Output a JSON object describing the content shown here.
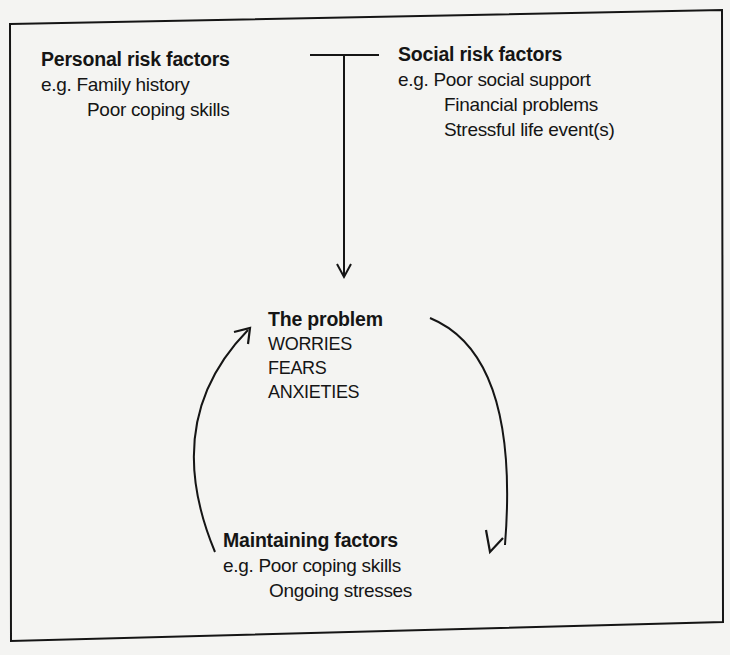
{
  "personal_risk": {
    "title": "Personal risk factors",
    "prefix": "e.g.",
    "items": [
      "Family history",
      "Poor coping skills"
    ]
  },
  "social_risk": {
    "title": "Social risk factors",
    "prefix": "e.g.",
    "items": [
      "Poor social support",
      "Financial problems",
      "Stressful life event(s)"
    ]
  },
  "problem": {
    "title": "The problem",
    "items": [
      "WORRIES",
      "FEARS",
      "ANXIETIES"
    ]
  },
  "maintaining": {
    "title": "Maintaining factors",
    "prefix": "e.g.",
    "items": [
      "Poor coping skills",
      "Ongoing stresses"
    ]
  },
  "colors": {
    "ink": "#151515",
    "paper": "#f4f4f2"
  }
}
